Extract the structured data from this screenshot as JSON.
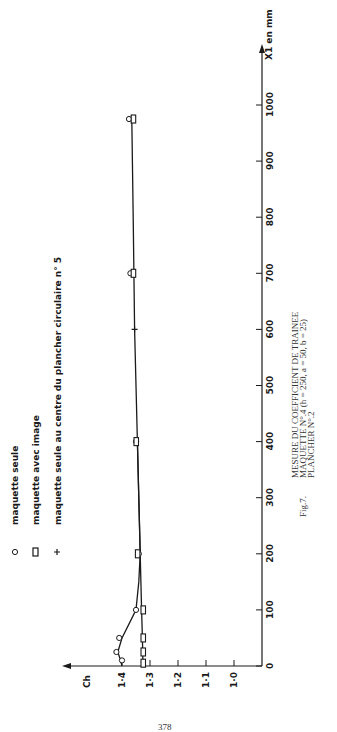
{
  "chart_data": {
    "type": "scatter",
    "orientation": "rotated-90-ccw",
    "title": "MESURE DU COEFFICIENT DE TRAINEE",
    "caption": {
      "fig": "Fig.7.",
      "line1": "MESURE DU COEFFICIENT DE TRAINEE",
      "line2": "MAQUETTE N°.4 (h = 250, a = 50, b = 25)",
      "line3": "PLANCHER N°.2"
    },
    "xlabel": "X1 en mm",
    "ylabel": "Ch",
    "xlim": [
      0,
      1050
    ],
    "ylim": [
      1.0,
      1.45
    ],
    "x_ticks": [
      0,
      100,
      200,
      300,
      400,
      500,
      600,
      700,
      800,
      900,
      1000
    ],
    "y_ticks": [
      1.0,
      1.1,
      1.2,
      1.3,
      1.4
    ],
    "y_tick_labels": [
      "1·0",
      "1·1",
      "1·2",
      "1·3",
      "1·4"
    ],
    "grid": false,
    "legend": [
      {
        "marker": "circle",
        "symbol": "o",
        "label": "maquette seule"
      },
      {
        "marker": "square",
        "symbol": "▯",
        "label": "maquette avec image"
      },
      {
        "marker": "plus",
        "symbol": "+",
        "label": "maquette seule au centre du plancher circulaire n° 5"
      }
    ],
    "series": [
      {
        "name": "maquette seule",
        "marker": "circle",
        "x": [
          10,
          25,
          50,
          100,
          200,
          400,
          700,
          975
        ],
        "y": [
          1.4,
          1.42,
          1.41,
          1.35,
          1.34,
          1.35,
          1.37,
          1.375
        ]
      },
      {
        "name": "maquette avec image",
        "marker": "square",
        "x": [
          5,
          25,
          50,
          100,
          200,
          400,
          700,
          975
        ],
        "y": [
          1.325,
          1.325,
          1.325,
          1.325,
          1.345,
          1.35,
          1.36,
          1.36
        ]
      },
      {
        "name": "maquette seule au centre du plancher circulaire n° 5",
        "marker": "plus",
        "x": [
          600
        ],
        "y": [
          1.355
        ]
      }
    ],
    "curves": [
      {
        "name": "fit-seule",
        "x": [
          0,
          10,
          25,
          50,
          100,
          150,
          200,
          300,
          400,
          600,
          800,
          975
        ],
        "y": [
          1.4,
          1.405,
          1.415,
          1.4,
          1.35,
          1.34,
          1.335,
          1.34,
          1.345,
          1.355,
          1.36,
          1.365
        ]
      },
      {
        "name": "fit-image",
        "x": [
          0,
          50,
          100,
          200,
          300,
          400
        ],
        "y": [
          1.325,
          1.327,
          1.33,
          1.335,
          1.34,
          1.345
        ]
      }
    ]
  },
  "page": {
    "page_number": "378"
  }
}
